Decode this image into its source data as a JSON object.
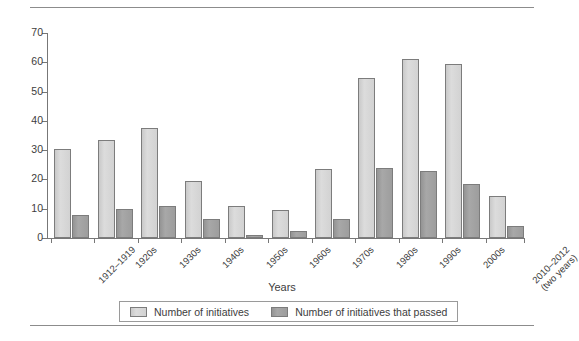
{
  "chart_data": {
    "type": "bar",
    "title": "",
    "xlabel": "Years",
    "ylabel": "",
    "ylim": [
      0,
      70
    ],
    "ytick_step": 10,
    "yticks": [
      0,
      10,
      20,
      30,
      40,
      50,
      60,
      70
    ],
    "grid": false,
    "legend_position": "bottom",
    "categories": [
      "1912–1919",
      "1920s",
      "1930s",
      "1940s",
      "1950s",
      "1960s",
      "1970s",
      "1980s",
      "1990s",
      "2000s",
      "2010–2012\n(two years)"
    ],
    "series": [
      {
        "name": "Number of initiatives",
        "color": "#d4d4d4",
        "values": [
          30.5,
          33.5,
          37.5,
          19.5,
          11,
          9.5,
          23.5,
          54.5,
          61,
          59.5,
          14.5
        ]
      },
      {
        "name": "Number of initiatives that passed",
        "color": "#a0a0a0",
        "values": [
          8,
          10,
          11,
          6.5,
          1,
          2.5,
          6.5,
          24,
          23,
          18.5,
          4
        ]
      }
    ]
  },
  "axis": {
    "x_title": "Years",
    "y_tick_labels": [
      "70",
      "60",
      "50",
      "40",
      "30",
      "20",
      "10",
      "0"
    ],
    "x_tick_labels": [
      "1912–1919",
      "1920s",
      "1930s",
      "1940s",
      "1950s",
      "1960s",
      "1970s",
      "1980s",
      "1990s",
      "2000s",
      "2010–2012",
      "(two years)"
    ]
  },
  "legend": {
    "items": [
      {
        "label": "Number of initiatives",
        "swatch": "light-gray-swatch",
        "color": "#d4d4d4"
      },
      {
        "label": "Number of initiatives that passed",
        "swatch": "dark-gray-swatch",
        "color": "#a0a0a0"
      }
    ]
  }
}
